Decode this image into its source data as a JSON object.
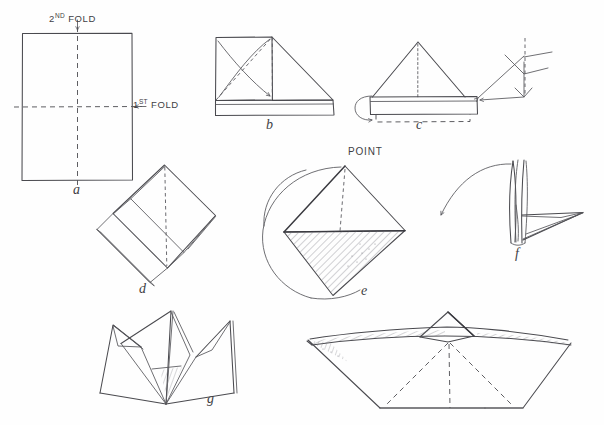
{
  "diagram": {
    "medium": "hand-drawn pencil sketch",
    "background_color": "#fefefe",
    "ink_color": "#4a4a4f",
    "width": 604,
    "height": 425
  },
  "annotations": {
    "second_fold": {
      "text_main": "FOLD",
      "text_ordinal": "2",
      "text_suffix": "ND",
      "full": "2ND FOLD"
    },
    "first_fold": {
      "text_main": "FOLD",
      "text_ordinal": "1",
      "text_suffix": "ST",
      "full": "1ST FOLD"
    },
    "point": {
      "text": "POINT"
    }
  },
  "steps": [
    {
      "id": "a",
      "label": "a",
      "description": "Flat rectangular sheet with 1st fold horizontal crease and 2nd fold vertical crease"
    },
    {
      "id": "b",
      "label": "b",
      "description": "Corner folded down to center with curved motion arrow"
    },
    {
      "id": "c",
      "label": "c",
      "description": "Both corners folded to form triangle above a band, flaps folded up"
    },
    {
      "id": "d",
      "label": "d",
      "description": "Square base opened into a diamond"
    },
    {
      "id": "e",
      "label": "e",
      "description": "Diamond with POINT at top, shaded lower half, rotation circle"
    },
    {
      "id": "f",
      "label": "f",
      "description": "Model pulled open from the sides"
    },
    {
      "id": "g",
      "label": "g",
      "description": "Opened form seen from the front before flattening"
    },
    {
      "id": "h",
      "label": "",
      "description": "Finished paper boat"
    }
  ],
  "colors": {
    "ink": "#4a4a4f",
    "ink_light": "#6a6a70",
    "paper": "#fefefe"
  }
}
